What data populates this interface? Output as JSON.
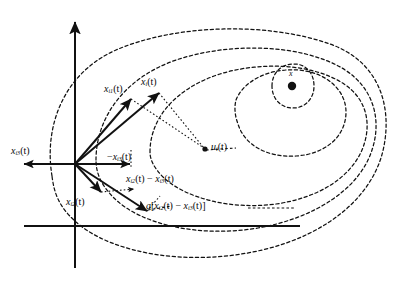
{
  "figure": {
    "kind": "vector-decomposition-contour-diagram",
    "background": "#ffffff",
    "ink": "#111111",
    "width": 399,
    "height": 284
  },
  "axes": {
    "vertical_axis_name": "vertical-axis",
    "horizontal_axis_name": "horizontal-axis",
    "origin": {
      "x": 75,
      "y": 164
    },
    "vertical_top": {
      "x": 75,
      "y": 20
    },
    "vertical_bottom": {
      "x": 75,
      "y": 268
    },
    "horizontal_left": {
      "x": 18,
      "y": 226
    },
    "horizontal_right": {
      "x": 300,
      "y": 226
    }
  },
  "labels": {
    "x_i1": {
      "base": "x",
      "sub": "i1",
      "arg": "(t)",
      "text": "x i1 (t)"
    },
    "x_i": {
      "base": "x",
      "sub": "i",
      "arg": "(t)",
      "text": "x i (t)"
    },
    "x_i3": {
      "base": "x",
      "sub": "i3",
      "arg": "(t)",
      "text": "x i3 (t)"
    },
    "x_i2": {
      "base": "x",
      "sub": "i2",
      "arg": "(t)",
      "text": "x i2 (t)"
    },
    "neg_x_i3": {
      "text": "- x i3 (t)",
      "prefix": "−"
    },
    "diff_x": {
      "text": "x i2 (t) - x i3 (t)"
    },
    "a_bracket": {
      "text": "a [ x i2 (t) - x i3 (t) ]"
    },
    "u_i": {
      "base": "u",
      "sub": "i",
      "arg": "(t)",
      "text": "u i (t)"
    },
    "center_point": {
      "text": "x"
    }
  },
  "vectors": [
    {
      "name": "vector-x-i1",
      "from": [
        75,
        164
      ],
      "to": [
        132,
        98
      ],
      "style": "solid-arrow"
    },
    {
      "name": "vector-x-i",
      "from": [
        75,
        164
      ],
      "to": [
        160,
        92
      ],
      "style": "solid-arrow"
    },
    {
      "name": "vector-x-i3-negative",
      "from": [
        75,
        164
      ],
      "to": [
        133,
        164
      ],
      "style": "solid-arrow"
    },
    {
      "name": "vector-x-i2",
      "from": [
        75,
        164
      ],
      "to": [
        102,
        193
      ],
      "style": "solid-arrow"
    },
    {
      "name": "vector-difference",
      "from": [
        75,
        164
      ],
      "to": [
        148,
        212
      ],
      "style": "solid-arrow"
    },
    {
      "name": "vector-u-i",
      "from": [
        160,
        92
      ],
      "to": [
        207,
        150
      ],
      "style": "dotted-arrow"
    },
    {
      "name": "dotted-connector-x-i1",
      "from": [
        132,
        98
      ],
      "to": [
        207,
        150
      ],
      "style": "dotted"
    },
    {
      "name": "dotted-connector-x-i2",
      "from": [
        102,
        193
      ],
      "to": [
        135,
        190
      ],
      "style": "dotted-arrow"
    },
    {
      "name": "dotted-connector-bracket",
      "from": [
        148,
        212
      ],
      "to": [
        155,
        205
      ],
      "style": "dotted"
    },
    {
      "name": "dashed-link-u-to-contour",
      "from": [
        207,
        150
      ],
      "to": [
        300,
        140
      ],
      "style": "dashed"
    }
  ],
  "contours": [
    {
      "name": "contour-level-1-outermost",
      "style": "dashed"
    },
    {
      "name": "contour-level-2",
      "style": "dashed"
    },
    {
      "name": "contour-level-3",
      "style": "dashed"
    },
    {
      "name": "contour-level-4",
      "style": "dashed"
    },
    {
      "name": "contour-level-5-innermost",
      "style": "dashed"
    }
  ],
  "center_marker": {
    "name": "contour-center-dot",
    "x": 292,
    "y": 86,
    "radius": 4.2
  }
}
